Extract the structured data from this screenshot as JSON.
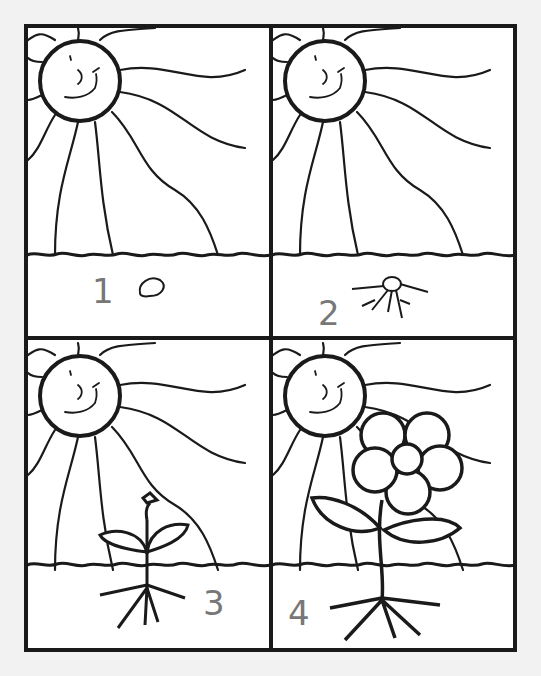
{
  "worksheet": {
    "title": "Plant life cycle coloring sequence",
    "panels": [
      {
        "index": 1,
        "stage": "seed",
        "handwritten_label": "1"
      },
      {
        "index": 2,
        "stage": "sprouting seed with roots",
        "handwritten_label": "2"
      },
      {
        "index": 3,
        "stage": "seedling with leaves and roots",
        "handwritten_label": "3"
      },
      {
        "index": 4,
        "stage": "flowering plant",
        "handwritten_label": "4"
      }
    ],
    "colors": {
      "line": "#1a1a1a",
      "paper": "#f2f2f2",
      "pencil": "#777777"
    }
  }
}
